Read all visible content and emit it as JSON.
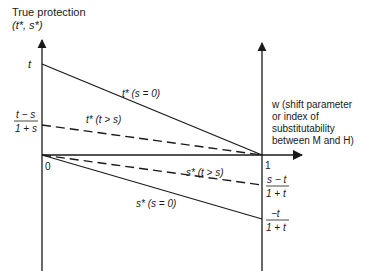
{
  "title": {
    "line1": "True protection",
    "line2": "(t*, s*)"
  },
  "axes": {
    "left_origin_label": "0",
    "right_label": "1",
    "w_axis_label": {
      "line1": "w (shift parameter",
      "line2": "or index of",
      "line3": "substitutability",
      "line4": "between M and H)"
    }
  },
  "left_values": {
    "t": "t",
    "t_minus_s_num": "t − s",
    "t_minus_s_den": "1 + s"
  },
  "right_values": {
    "s_minus_t_num": "s − t",
    "s_minus_t_den": "1 + t",
    "neg_t_num": "−t",
    "neg_t_den": "1 + t"
  },
  "lines": [
    {
      "name": "t-star-s-zero",
      "label": "t* (s = 0)",
      "style": "solid",
      "from": [
        0,
        "t"
      ],
      "to": [
        1,
        0
      ]
    },
    {
      "name": "t-star-t-gt-s",
      "label": "t* (t > s)",
      "style": "dashed",
      "from": [
        0,
        "(t−s)/(1+s)"
      ],
      "to": [
        1,
        0
      ]
    },
    {
      "name": "s-star-t-gt-s",
      "label": "s* (t > s)",
      "style": "dashed",
      "from": [
        0,
        0
      ],
      "to": [
        1,
        "(s−t)/(1+t)"
      ]
    },
    {
      "name": "s-star-s-zero",
      "label": "s* (s = 0)",
      "style": "solid",
      "from": [
        0,
        0
      ],
      "to": [
        1,
        "−t/(1+t)"
      ]
    }
  ],
  "colors": {
    "ink": "#1a1a1a",
    "background": "#ffffff"
  }
}
